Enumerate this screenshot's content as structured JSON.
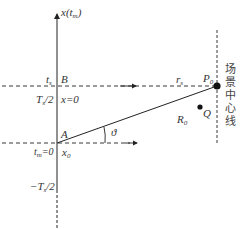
{
  "diagram": {
    "axis_label": "x(t",
    "axis_label_sub": "m",
    "axis_label_close": ")",
    "points": {
      "B": "B",
      "A": "A",
      "P0": "P",
      "P0_sub": "0",
      "Q": "Q"
    },
    "labels": {
      "t_s": "t",
      "t_s_sub": "s",
      "Ts_half": "T",
      "Ts_half_sub": "s",
      "Ts_half_rest": "/2",
      "x_zero": "x=0",
      "tm_zero": "t",
      "tm_zero_sub": "m",
      "tm_zero_rest": "=0",
      "x0": "x",
      "x0_sub": "0",
      "neg_Ts_half": "−T",
      "neg_Ts_half_sub": "s",
      "neg_Ts_half_rest": "/2",
      "r_s": "r",
      "r_s_sub": "s",
      "R_0": "R",
      "R_0_sub": "0",
      "theta": "ϑ"
    },
    "scene_center_line": [
      "场",
      "景",
      "中",
      "心",
      "线"
    ],
    "colors": {
      "line": "#222222",
      "text": "#333333"
    }
  }
}
